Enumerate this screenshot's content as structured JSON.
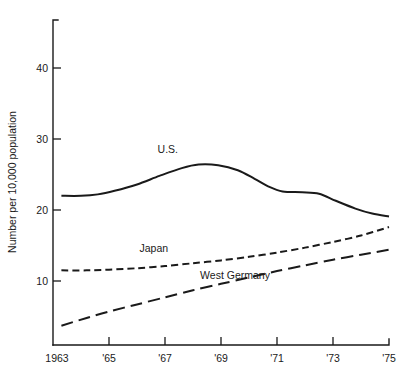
{
  "chart_data": {
    "type": "line",
    "title": "",
    "xlabel": "",
    "ylabel": "Number per 10,000 population",
    "xlim": [
      1963,
      1975
    ],
    "ylim": [
      0,
      46
    ],
    "grid": false,
    "legend_position": "inline-labels",
    "x_tick_labels": [
      "1963",
      "'65",
      "'67",
      "'69",
      "'71",
      "'73",
      "'75"
    ],
    "x_tick_values": [
      1963,
      1965,
      1967,
      1969,
      1971,
      1973,
      1975
    ],
    "y_tick_labels": [
      "10",
      "20",
      "30",
      "40"
    ],
    "y_tick_values": [
      10,
      20,
      30,
      40
    ],
    "series": [
      {
        "name": "U.S.",
        "style": "solid",
        "label_x": 1967.1,
        "label_y": 28.0,
        "x": [
          1963.3,
          1964.0,
          1964.6,
          1965.2,
          1966.0,
          1966.8,
          1967.6,
          1968.2,
          1968.9,
          1969.6,
          1970.2,
          1970.7,
          1971.2,
          1971.9,
          1972.5,
          1973.1,
          1973.8,
          1974.4,
          1975.0
        ],
        "values": [
          22.0,
          22.0,
          22.2,
          22.7,
          23.6,
          24.8,
          25.9,
          26.4,
          26.3,
          25.6,
          24.4,
          23.3,
          22.6,
          22.5,
          22.3,
          21.3,
          20.2,
          19.5,
          19.1
        ]
      },
      {
        "name": "Japan",
        "style": "dotted",
        "label_x": 1966.6,
        "label_y": 14.1,
        "x": [
          1963.3,
          1964.2,
          1965.0,
          1966.0,
          1967.0,
          1968.0,
          1969.0,
          1970.0,
          1971.0,
          1972.0,
          1973.0,
          1974.0,
          1975.0
        ],
        "values": [
          11.5,
          11.5,
          11.6,
          11.8,
          12.1,
          12.5,
          12.9,
          13.4,
          14.0,
          14.7,
          15.5,
          16.4,
          17.6
        ]
      },
      {
        "name": "West Germany",
        "style": "dashed",
        "label_x": 1969.5,
        "label_y": 10.3,
        "x": [
          1963.3,
          1964.2,
          1965.0,
          1966.0,
          1967.0,
          1968.0,
          1969.0,
          1970.0,
          1971.0,
          1972.0,
          1973.0,
          1974.0,
          1975.0
        ],
        "values": [
          3.7,
          4.8,
          5.7,
          6.7,
          7.7,
          8.7,
          9.6,
          10.5,
          11.4,
          12.2,
          13.0,
          13.7,
          14.4
        ]
      }
    ]
  },
  "axis": {
    "y_title": "Number per 10,000 population"
  },
  "labels": {
    "us": "U.S.",
    "japan": "Japan",
    "west_germany": "West Germany"
  },
  "ticks": {
    "y": [
      "40",
      "30",
      "20",
      "10"
    ],
    "x": [
      "1963",
      "'65",
      "'67",
      "'69",
      "'71",
      "'73",
      "'75"
    ]
  },
  "colors": {
    "ink": "#1a1a1a",
    "background": "#ffffff"
  }
}
